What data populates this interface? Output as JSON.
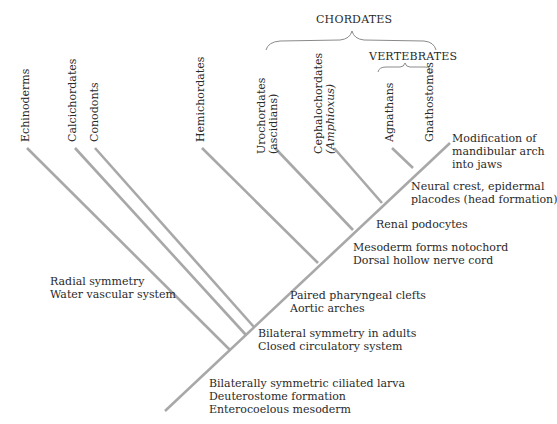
{
  "groups": {
    "chordates": "CHORDATES",
    "vertebrates": "VERTEBRATES"
  },
  "taxa": [
    {
      "id": "echinoderms",
      "lines": [
        "Echinoderms"
      ]
    },
    {
      "id": "calcichordates",
      "lines": [
        "Calcichordates"
      ]
    },
    {
      "id": "conodonts",
      "lines": [
        "Conodonts"
      ]
    },
    {
      "id": "hemichordates",
      "lines": [
        "Hemichordates"
      ]
    },
    {
      "id": "urochordates",
      "lines": [
        "Urochordates",
        "(ascidians)"
      ]
    },
    {
      "id": "cephalochordates",
      "lines": [
        "Cephalochordates",
        "(Amphioxus)"
      ]
    },
    {
      "id": "agnathans",
      "lines": [
        "Agnathans"
      ]
    },
    {
      "id": "gnathostomes",
      "lines": [
        "Gnathostomes"
      ]
    }
  ],
  "traits": {
    "jaws": [
      "Modification of",
      "mandibular arch",
      "into jaws"
    ],
    "neural_crest": [
      "Neural crest, epidermal",
      "placodes (head formation)"
    ],
    "renal": [
      "Renal podocytes"
    ],
    "notochord": [
      "Mesoderm forms notochord",
      "Dorsal hollow nerve cord"
    ],
    "radial": [
      "Radial symmetry",
      "Water vascular system"
    ],
    "pharyngeal": [
      "Paired pharyngeal clefts",
      "Aortic arches"
    ],
    "bilateral_adults": [
      "Bilateral symmetry in adults",
      "Closed circulatory system"
    ],
    "root": [
      "Bilaterally symmetric ciliated larva",
      "Deuterostome formation",
      "Enterocoelous mesoderm"
    ]
  },
  "colors": {
    "line": "#a8a8a8",
    "text": "#2a2a2a"
  }
}
